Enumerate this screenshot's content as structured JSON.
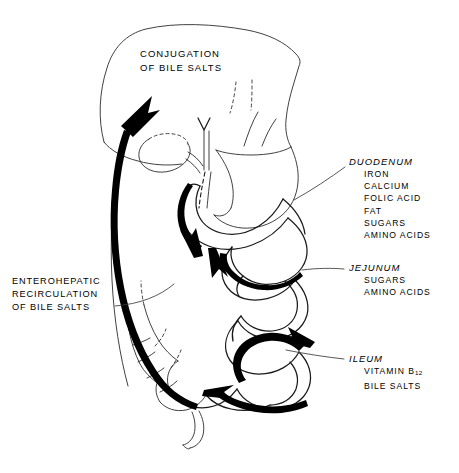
{
  "figure": {
    "title_overlay": {
      "line1": "CONJUGATION",
      "line2": "OF BILE SALTS"
    },
    "left_annotation": {
      "line1": "ENTEROHEPATIC",
      "line2": "RECIRCULATION",
      "line3": "OF BILE SALTS"
    },
    "regions": [
      {
        "name": "DUODENUM",
        "absorbed": [
          "IRON",
          "CALCIUM",
          "FOLIC ACID",
          "FAT",
          "SUGARS",
          "AMINO ACIDS"
        ]
      },
      {
        "name": "JEJUNUM",
        "absorbed": [
          "SUGARS",
          "AMINO ACIDS"
        ]
      },
      {
        "name": "ILEUM",
        "absorbed": [
          "VITAMIN B12",
          "BILE SALTS"
        ],
        "absorbed_rich": [
          {
            "text": "VITAMIN B",
            "sub": "12"
          },
          {
            "text": "BILE SALTS",
            "sub": ""
          }
        ]
      }
    ],
    "colors": {
      "ink": "#1a1a1a",
      "arrow": "#000000",
      "background": "#ffffff",
      "leader": "#3a3a3a"
    }
  }
}
